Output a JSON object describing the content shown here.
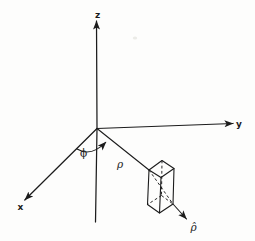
{
  "figure": {
    "kind": "coordinate-system-diagram",
    "colors": {
      "line": "#1c1c1c",
      "background": "#fdfdfc"
    },
    "labels": {
      "z_axis": "z",
      "y_axis": "y",
      "x_axis": "x",
      "phi_angle": "ϕ",
      "rho_distance": "ρ",
      "rho_unit_vector": "ρ̂"
    }
  }
}
